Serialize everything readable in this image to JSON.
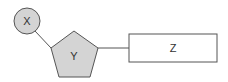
{
  "diagram": {
    "nodes": [
      {
        "id": "X",
        "label": "X",
        "shape": "circle",
        "fill": "#d4d4d4"
      },
      {
        "id": "Y",
        "label": "Y",
        "shape": "pentagon",
        "fill": "#d4d4d4"
      },
      {
        "id": "Z",
        "label": "Z",
        "shape": "rectangle",
        "fill": "#ffffff"
      }
    ],
    "edges": [
      {
        "from": "X",
        "to": "Y"
      },
      {
        "from": "Y",
        "to": "Z"
      }
    ],
    "colors": {
      "stroke": "#555555",
      "shape_fill": "#d4d4d4"
    }
  }
}
